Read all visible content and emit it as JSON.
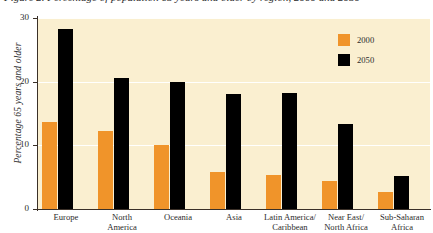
{
  "title": "Figure 2. Percentage of population 65 years and older by region, 2000 and 2050",
  "chart_data": {
    "type": "bar",
    "title": "Figure 2. Percentage of population 65 years and older by region, 2000 and 2050",
    "xlabel": "",
    "ylabel": "Percentage 65 years and older",
    "ylim": [
      0,
      30
    ],
    "yticks": [
      "0",
      "10",
      "20",
      "30"
    ],
    "ytick_values": [
      0,
      10,
      20,
      30
    ],
    "grid": "horizontal-white",
    "legend_position": "top-right-inside",
    "categories": [
      "Europe",
      "North America",
      "Oceania",
      "Asia",
      "Latin America/ Caribbean",
      "Near East/ North Africa",
      "Sub-Saharan Africa"
    ],
    "category_lines": [
      [
        "Europe"
      ],
      [
        "North",
        "America"
      ],
      [
        "Oceania"
      ],
      [
        "Asia"
      ],
      [
        "Latin America/",
        "Caribbean"
      ],
      [
        "Near East/",
        "North Africa"
      ],
      [
        "Sub-Saharan",
        "Africa"
      ]
    ],
    "series": [
      {
        "name": "2000",
        "color": "#f0942a",
        "values": [
          13.7,
          12.3,
          10.0,
          5.8,
          5.3,
          4.4,
          2.7
        ]
      },
      {
        "name": "2050",
        "color": "#000000",
        "values": [
          28.3,
          20.6,
          20.0,
          18.0,
          18.3,
          13.3,
          5.2
        ]
      }
    ]
  },
  "legend": {
    "items": [
      {
        "label": "2000",
        "color": "#f0942a"
      },
      {
        "label": "2050",
        "color": "#000000"
      }
    ]
  },
  "colors": {
    "series_2000": "#f0942a",
    "series_2050": "#000000",
    "plot_background": "#faefd0",
    "page_background": "#ffffff",
    "axis": "#3a3028",
    "gridline": "#ffffff"
  }
}
